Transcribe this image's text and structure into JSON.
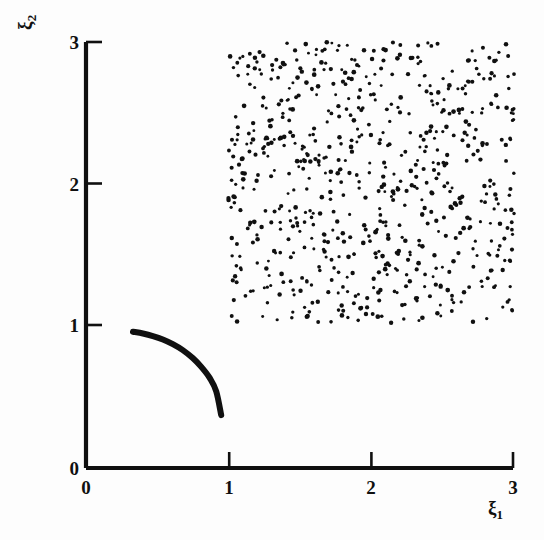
{
  "figure": {
    "background_color": "#fdfdfd",
    "ink_color": "#101010"
  },
  "axes": {
    "x_title": "ξ",
    "x_title_sub": "1",
    "y_title": "ξ",
    "y_title_sub": "2",
    "x_ticks": [
      "0",
      "1",
      "2",
      "3"
    ],
    "y_ticks": [
      "0",
      "1",
      "2",
      "3"
    ],
    "origin_label": "0"
  },
  "chart_data": {
    "type": "scatter",
    "title": "",
    "xlabel": "ξ₁",
    "ylabel": "ξ₂",
    "xlim": [
      0,
      3
    ],
    "ylim": [
      0,
      3
    ],
    "xticks": [
      0,
      1,
      2,
      3
    ],
    "yticks": [
      0,
      1,
      2,
      3
    ],
    "grid": false,
    "legend": "none",
    "series": [
      {
        "name": "uniform-random-sample",
        "type": "scatter",
        "marker": "dot",
        "marker_size_px": 3.4,
        "color": "#101010",
        "n_points": 700,
        "region": {
          "x": [
            1.0,
            3.01
          ],
          "y": [
            1.02,
            3.0
          ]
        },
        "distribution": "uniform",
        "seed": 20240611,
        "note": "Dense uniform cloud of small black dots filling the square [1,3]x[1,3]."
      },
      {
        "name": "constraint-curve",
        "type": "line",
        "color": "#101010",
        "line_width_px": 6.0,
        "x": [
          0.33,
          0.4,
          0.47,
          0.54,
          0.61,
          0.68,
          0.75,
          0.81,
          0.87,
          0.915,
          0.95
        ],
        "y": [
          0.96,
          0.947,
          0.929,
          0.905,
          0.872,
          0.83,
          0.774,
          0.712,
          0.633,
          0.54,
          0.372
        ],
        "note": "Single thick concave arc in the lower-left, falling from (0.33,0.96) to (0.95,0.37)."
      }
    ]
  }
}
